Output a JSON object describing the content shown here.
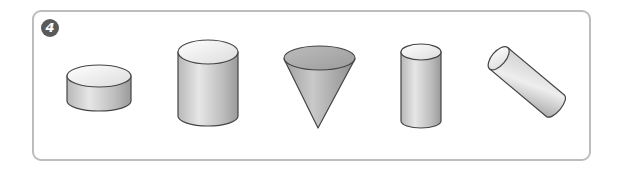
{
  "problem": {
    "number": "4",
    "shapes": [
      {
        "name": "short-cylinder",
        "label": "short wide cylinder"
      },
      {
        "name": "tall-cylinder",
        "label": "tall wide cylinder"
      },
      {
        "name": "cone",
        "label": "inverted cone"
      },
      {
        "name": "narrow-cylinder",
        "label": "narrow upright cylinder"
      },
      {
        "name": "tilted-cylinder",
        "label": "tilted cylinder"
      }
    ]
  },
  "colors": {
    "frame": "#bdbdbd",
    "badge": "#5a5a5a",
    "outline": "#444444",
    "top_face": "#f2f2f2",
    "cone_top": "#a8a8a8"
  }
}
